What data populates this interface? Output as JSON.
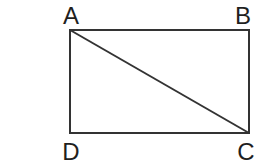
{
  "diagram": {
    "type": "geometry",
    "shape": "rectangle",
    "vertices": [
      {
        "label": "A",
        "position": "top-left"
      },
      {
        "label": "B",
        "position": "top-right"
      },
      {
        "label": "C",
        "position": "bottom-right"
      },
      {
        "label": "D",
        "position": "bottom-left"
      }
    ],
    "edges": [
      "AB",
      "BC",
      "CD",
      "DA"
    ],
    "diagonal": {
      "from": "A",
      "to": "C"
    },
    "colors": {
      "line": "#333333",
      "label": "#1f1f1f",
      "background": "#ffffff"
    }
  }
}
